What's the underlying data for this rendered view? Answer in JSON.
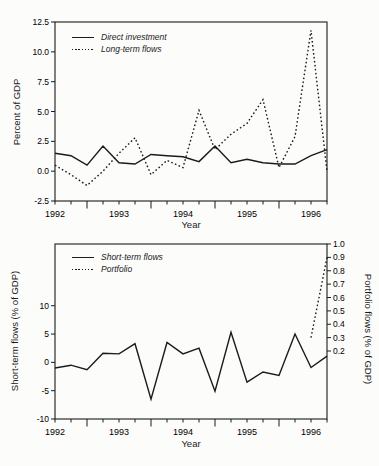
{
  "figure": {
    "background": "#fcfcfb",
    "line_color": "#1b1b1b"
  },
  "chart_data": [
    {
      "type": "line",
      "title": "",
      "xlabel": "Year",
      "ylabel": "Percent of GDP",
      "grid": false,
      "legend_position": "top-left",
      "xlim": [
        1992.0,
        1996.25
      ],
      "ylim": [
        -2.5,
        12.5
      ],
      "x_year_labels": [
        "1992",
        "1993",
        "1994",
        "1995",
        "1996"
      ],
      "y_ticks": {
        "labels": [
          "12.5",
          "10.0",
          "7.5",
          "5.0",
          "2.5",
          "0.0",
          "-2.5"
        ],
        "values": [
          12.5,
          10.0,
          7.5,
          5.0,
          2.5,
          0.0,
          -2.5
        ]
      },
      "x": [
        1992.0,
        1992.25,
        1992.5,
        1992.75,
        1993.0,
        1993.25,
        1993.5,
        1993.75,
        1994.0,
        1994.25,
        1994.5,
        1994.75,
        1995.0,
        1995.25,
        1995.5,
        1995.75,
        1996.0,
        1996.25
      ],
      "series": [
        {
          "name": "Direct investment",
          "style": "solid",
          "axis": "left",
          "values": [
            1.5,
            1.3,
            0.5,
            2.1,
            0.7,
            0.6,
            1.4,
            1.3,
            1.2,
            0.8,
            2.1,
            0.7,
            1.0,
            0.7,
            0.6,
            0.6,
            1.3,
            1.8
          ]
        },
        {
          "name": "Long-term flows",
          "style": "dotted",
          "axis": "left",
          "values": [
            0.5,
            -0.3,
            -1.2,
            0.0,
            1.5,
            2.8,
            -0.3,
            0.9,
            0.3,
            5.1,
            1.8,
            3.1,
            4.0,
            6.0,
            0.3,
            2.9,
            11.8,
            0.0
          ]
        }
      ]
    },
    {
      "type": "line",
      "title": "",
      "xlabel": "Year",
      "ylabel_left": "Short-term flows (% of GDP)",
      "ylabel_right": "Portfolio flows (% of GDP)",
      "grid": false,
      "legend_position": "top-left",
      "xlim": [
        1992.0,
        1996.25
      ],
      "ylim_left": [
        -10,
        20.9
      ],
      "ylim_right": [
        0.2,
        1.0
      ],
      "x_year_labels": [
        "1992",
        "1993",
        "1994",
        "1995",
        "1996"
      ],
      "y_ticks_left": {
        "labels": [
          "10",
          "5",
          "0",
          "-5",
          "-10"
        ],
        "values": [
          10,
          5,
          0,
          -5,
          -10
        ]
      },
      "y_ticks_right": {
        "labels": [
          "1.0",
          "0.9",
          "0.8",
          "0.7",
          "0.6",
          "0.5",
          "0.4",
          "0.3",
          "0.2"
        ],
        "values": [
          1.0,
          0.9,
          0.8,
          0.7,
          0.6,
          0.5,
          0.4,
          0.3,
          0.2
        ]
      },
      "x": [
        1992.0,
        1992.25,
        1992.5,
        1992.75,
        1993.0,
        1993.25,
        1993.5,
        1993.75,
        1994.0,
        1994.25,
        1994.5,
        1994.75,
        1995.0,
        1995.25,
        1995.5,
        1995.75,
        1996.0,
        1996.25
      ],
      "series": [
        {
          "name": "Short-term flows",
          "style": "solid",
          "axis": "left",
          "values": [
            -1.0,
            -0.5,
            -1.3,
            1.6,
            1.5,
            3.3,
            -6.5,
            3.5,
            1.5,
            2.5,
            -5.1,
            5.3,
            -3.5,
            -1.7,
            -2.3,
            5.0,
            -0.9,
            1.1
          ]
        },
        {
          "name": "Portfolio",
          "style": "dotted",
          "axis": "right",
          "values": [
            null,
            null,
            null,
            null,
            null,
            null,
            null,
            null,
            null,
            null,
            null,
            null,
            null,
            null,
            null,
            null,
            0.3,
            0.9
          ]
        }
      ]
    }
  ]
}
